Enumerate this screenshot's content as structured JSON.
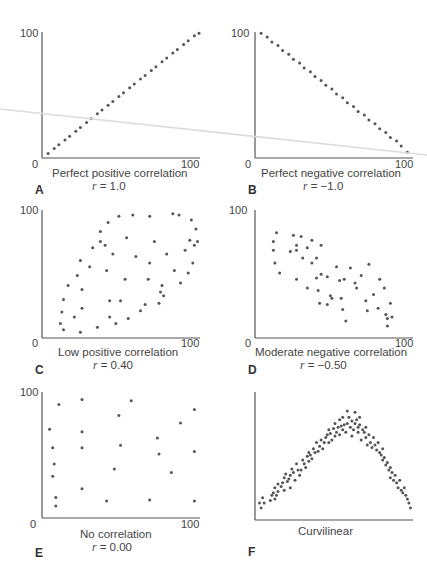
{
  "chart_data": [
    {
      "id": "A",
      "type": "scatter",
      "title": "Perfect positive correlation",
      "r_label": "r",
      "r_value": "= 1.0",
      "x_ticks": [
        "0",
        "100"
      ],
      "y_ticks": [
        "100"
      ],
      "xlim": [
        0,
        100
      ],
      "ylim": [
        0,
        100
      ],
      "points": [
        [
          2,
          2
        ],
        [
          6,
          6
        ],
        [
          9,
          9
        ],
        [
          13,
          13
        ],
        [
          16,
          16
        ],
        [
          20,
          20
        ],
        [
          23,
          23
        ],
        [
          27,
          27
        ],
        [
          30,
          30
        ],
        [
          34,
          34
        ],
        [
          37,
          37
        ],
        [
          41,
          41
        ],
        [
          44,
          44
        ],
        [
          48,
          48
        ],
        [
          51,
          51
        ],
        [
          55,
          55
        ],
        [
          58,
          58
        ],
        [
          62,
          62
        ],
        [
          65,
          65
        ],
        [
          69,
          69
        ],
        [
          72,
          72
        ],
        [
          76,
          76
        ],
        [
          79,
          79
        ],
        [
          83,
          83
        ],
        [
          86,
          86
        ],
        [
          90,
          90
        ],
        [
          93,
          93
        ],
        [
          97,
          97
        ],
        [
          100,
          99
        ]
      ]
    },
    {
      "id": "B",
      "type": "scatter",
      "title": "Perfect negative correlation",
      "r_label": "r",
      "r_value": "= −1.0",
      "x_ticks": [
        "0",
        "100"
      ],
      "y_ticks": [
        "100"
      ],
      "xlim": [
        0,
        100
      ],
      "ylim": [
        0,
        100
      ],
      "points": [
        [
          2,
          99
        ],
        [
          6,
          96
        ],
        [
          9,
          92
        ],
        [
          13,
          89
        ],
        [
          16,
          85
        ],
        [
          20,
          82
        ],
        [
          23,
          78
        ],
        [
          27,
          75
        ],
        [
          30,
          71
        ],
        [
          34,
          68
        ],
        [
          37,
          64
        ],
        [
          41,
          61
        ],
        [
          44,
          57
        ],
        [
          48,
          54
        ],
        [
          51,
          50
        ],
        [
          55,
          47
        ],
        [
          58,
          43
        ],
        [
          62,
          40
        ],
        [
          65,
          36
        ],
        [
          69,
          33
        ],
        [
          72,
          29
        ],
        [
          76,
          26
        ],
        [
          79,
          22
        ],
        [
          83,
          19
        ],
        [
          86,
          15
        ],
        [
          90,
          12
        ],
        [
          93,
          8
        ],
        [
          97,
          3
        ]
      ]
    },
    {
      "id": "C",
      "type": "scatter",
      "title": "Low positive correlation",
      "r_label": "r",
      "r_value": "= 0.40",
      "x_ticks": [
        "0",
        "100"
      ],
      "y_ticks": [
        "100"
      ],
      "xlim": [
        0,
        100
      ],
      "ylim": [
        0,
        100
      ],
      "points": [
        [
          10,
          10
        ],
        [
          11,
          19
        ],
        [
          12,
          29
        ],
        [
          15,
          40
        ],
        [
          12,
          5
        ],
        [
          19,
          15
        ],
        [
          21,
          48
        ],
        [
          23,
          60
        ],
        [
          23,
          3
        ],
        [
          24,
          37
        ],
        [
          24,
          22
        ],
        [
          29,
          55
        ],
        [
          31,
          70
        ],
        [
          34,
          7
        ],
        [
          36,
          75
        ],
        [
          36,
          83
        ],
        [
          39,
          72
        ],
        [
          40,
          52
        ],
        [
          41,
          90
        ],
        [
          42,
          28
        ],
        [
          42,
          15
        ],
        [
          44,
          65
        ],
        [
          46,
          10
        ],
        [
          48,
          95
        ],
        [
          49,
          28
        ],
        [
          52,
          45
        ],
        [
          53,
          78
        ],
        [
          54,
          14
        ],
        [
          57,
          96
        ],
        [
          59,
          63
        ],
        [
          62,
          20
        ],
        [
          65,
          25
        ],
        [
          67,
          45
        ],
        [
          68,
          95
        ],
        [
          68,
          58
        ],
        [
          71,
          75
        ],
        [
          74,
          26
        ],
        [
          75,
          35
        ],
        [
          76,
          40
        ],
        [
          77,
          32
        ],
        [
          79,
          65
        ],
        [
          83,
          97
        ],
        [
          84,
          52
        ],
        [
          87,
          96
        ],
        [
          88,
          42
        ],
        [
          91,
          68
        ],
        [
          93,
          50
        ],
        [
          94,
          76
        ],
        [
          95,
          92
        ],
        [
          96,
          58
        ],
        [
          97,
          72
        ],
        [
          98,
          85
        ],
        [
          99,
          75
        ]
      ]
    },
    {
      "id": "D",
      "type": "scatter",
      "title": "Moderate negative correlation",
      "r_label": "r",
      "r_value": "= −0.50",
      "x_ticks": [
        "0",
        "100"
      ],
      "y_ticks": [
        "100"
      ],
      "xlim": [
        0,
        100
      ],
      "ylim": [
        0,
        100
      ],
      "points": [
        [
          10,
          75
        ],
        [
          12,
          82
        ],
        [
          10,
          68
        ],
        [
          11,
          58
        ],
        [
          14,
          50
        ],
        [
          21,
          67
        ],
        [
          23,
          80
        ],
        [
          25,
          72
        ],
        [
          25,
          68
        ],
        [
          25,
          45
        ],
        [
          28,
          79
        ],
        [
          29,
          62
        ],
        [
          32,
          70
        ],
        [
          32,
          38
        ],
        [
          35,
          76
        ],
        [
          35,
          58
        ],
        [
          38,
          62
        ],
        [
          38,
          46
        ],
        [
          39,
          36
        ],
        [
          40,
          26
        ],
        [
          41,
          72
        ],
        [
          41,
          49
        ],
        [
          45,
          47
        ],
        [
          45,
          25
        ],
        [
          47,
          32
        ],
        [
          48,
          30
        ],
        [
          51,
          55
        ],
        [
          53,
          44
        ],
        [
          54,
          30
        ],
        [
          55,
          21
        ],
        [
          56,
          45
        ],
        [
          57,
          12
        ],
        [
          60,
          54
        ],
        [
          63,
          42
        ],
        [
          64,
          38
        ],
        [
          67,
          48
        ],
        [
          70,
          28
        ],
        [
          71,
          20
        ],
        [
          72,
          57
        ],
        [
          75,
          33
        ],
        [
          78,
          22
        ],
        [
          79,
          45
        ],
        [
          82,
          38
        ],
        [
          83,
          17
        ],
        [
          84,
          14
        ],
        [
          84,
          8
        ],
        [
          86,
          26
        ],
        [
          87,
          15
        ]
      ]
    },
    {
      "id": "E",
      "type": "scatter",
      "title": "No correlation",
      "r_label": "r",
      "r_value": "= 0.00",
      "x_ticks": [
        "0",
        "100"
      ],
      "y_ticks": [
        "100"
      ],
      "xlim": [
        0,
        100
      ],
      "ylim": [
        0,
        100
      ],
      "points": [
        [
          3,
          70
        ],
        [
          5,
          55
        ],
        [
          6,
          42
        ],
        [
          5,
          32
        ],
        [
          7,
          15
        ],
        [
          7,
          8
        ],
        [
          9,
          90
        ],
        [
          24,
          94
        ],
        [
          24,
          68
        ],
        [
          24,
          55
        ],
        [
          24,
          22
        ],
        [
          40,
          12
        ],
        [
          45,
          38
        ],
        [
          48,
          81
        ],
        [
          49,
          57
        ],
        [
          56,
          93
        ],
        [
          68,
          13
        ],
        [
          73,
          63
        ],
        [
          74,
          50
        ],
        [
          82,
          35
        ],
        [
          88,
          75
        ],
        [
          97,
          86
        ],
        [
          97,
          52
        ],
        [
          97,
          12
        ]
      ]
    },
    {
      "id": "F",
      "type": "scatter",
      "title": "Curvilinear",
      "x_ticks": [],
      "y_ticks": [],
      "xlim": [
        0,
        100
      ],
      "ylim": [
        0,
        100
      ],
      "points": [
        [
          1,
          12
        ],
        [
          2,
          8
        ],
        [
          3,
          16
        ],
        [
          4,
          12
        ],
        [
          8,
          14
        ],
        [
          9,
          18
        ],
        [
          10,
          20
        ],
        [
          11,
          15
        ],
        [
          11,
          24
        ],
        [
          12,
          18
        ],
        [
          13,
          21
        ],
        [
          13,
          27
        ],
        [
          15,
          25
        ],
        [
          16,
          28
        ],
        [
          17,
          32
        ],
        [
          17,
          22
        ],
        [
          18,
          35
        ],
        [
          19,
          29
        ],
        [
          20,
          31
        ],
        [
          21,
          24
        ],
        [
          21,
          34
        ],
        [
          22,
          39
        ],
        [
          23,
          36
        ],
        [
          24,
          30
        ],
        [
          25,
          43
        ],
        [
          26,
          38
        ],
        [
          27,
          34
        ],
        [
          28,
          38
        ],
        [
          29,
          46
        ],
        [
          30,
          43
        ],
        [
          31,
          40
        ],
        [
          32,
          49
        ],
        [
          33,
          52
        ],
        [
          33,
          45
        ],
        [
          34,
          50
        ],
        [
          35,
          47
        ],
        [
          36,
          55
        ],
        [
          37,
          52
        ],
        [
          38,
          60
        ],
        [
          39,
          53
        ],
        [
          40,
          57
        ],
        [
          41,
          62
        ],
        [
          42,
          55
        ],
        [
          43,
          60
        ],
        [
          44,
          64
        ],
        [
          45,
          66
        ],
        [
          46,
          60
        ],
        [
          46,
          70
        ],
        [
          47,
          67
        ],
        [
          48,
          62
        ],
        [
          49,
          71
        ],
        [
          50,
          75
        ],
        [
          50,
          65
        ],
        [
          51,
          68
        ],
        [
          52,
          72
        ],
        [
          53,
          66
        ],
        [
          53,
          78
        ],
        [
          54,
          73
        ],
        [
          55,
          80
        ],
        [
          55,
          70
        ],
        [
          56,
          74
        ],
        [
          57,
          68
        ],
        [
          58,
          85
        ],
        [
          58,
          75
        ],
        [
          59,
          80
        ],
        [
          60,
          72
        ],
        [
          61,
          77
        ],
        [
          61,
          65
        ],
        [
          62,
          70
        ],
        [
          63,
          84
        ],
        [
          63,
          75
        ],
        [
          64,
          78
        ],
        [
          65,
          72
        ],
        [
          65,
          68
        ],
        [
          66,
          80
        ],
        [
          66,
          74
        ],
        [
          67,
          62
        ],
        [
          68,
          70
        ],
        [
          69,
          68
        ],
        [
          70,
          64
        ],
        [
          70,
          72
        ],
        [
          71,
          58
        ],
        [
          72,
          66
        ],
        [
          73,
          60
        ],
        [
          74,
          56
        ],
        [
          75,
          64
        ],
        [
          76,
          58
        ],
        [
          77,
          54
        ],
        [
          78,
          60
        ],
        [
          79,
          52
        ],
        [
          80,
          50
        ],
        [
          81,
          55
        ],
        [
          81,
          46
        ],
        [
          82,
          48
        ],
        [
          83,
          42
        ],
        [
          84,
          44
        ],
        [
          85,
          38
        ],
        [
          86,
          40
        ],
        [
          86,
          32
        ],
        [
          87,
          36
        ],
        [
          88,
          30
        ],
        [
          89,
          34
        ],
        [
          90,
          28
        ],
        [
          91,
          24
        ],
        [
          92,
          30
        ],
        [
          93,
          22
        ],
        [
          94,
          20
        ],
        [
          95,
          24
        ],
        [
          96,
          18
        ],
        [
          97,
          15
        ],
        [
          98,
          12
        ],
        [
          99,
          8
        ]
      ]
    }
  ],
  "colors": {
    "point": "#555555",
    "axis": "#555555",
    "text": "#444444",
    "crease": "#d8d8d8"
  }
}
